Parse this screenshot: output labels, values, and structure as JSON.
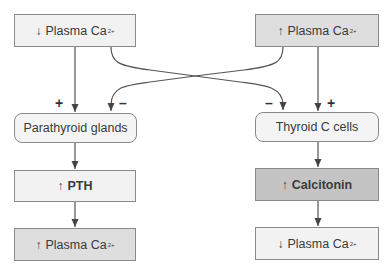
{
  "left_column": {
    "stimulus": {
      "arrow": "↓",
      "label": "Plasma Ca",
      "superscript": "2+"
    },
    "gland": {
      "label": "Parathyroid glands"
    },
    "hormone": {
      "arrow": "↑",
      "label": "PTH"
    },
    "result": {
      "arrow": "↑",
      "label": "Plasma Ca",
      "superscript": "2+"
    }
  },
  "right_column": {
    "stimulus": {
      "arrow": "↑",
      "label": "Plasma Ca",
      "superscript": "2+"
    },
    "gland": {
      "label": "Thyroid C cells"
    },
    "hormone": {
      "arrow": "↑",
      "label": "Calcitonin"
    },
    "result": {
      "arrow": "↓",
      "label": "Plasma Ca",
      "superscript": "2+"
    }
  },
  "signs": {
    "left_plus": "+",
    "left_minus": "–",
    "right_minus": "–",
    "right_plus": "+"
  },
  "colors": {
    "box_light": "#f2f2f2",
    "box_mid": "#dedede",
    "box_dark": "#c4c4c4",
    "line": "#555555"
  }
}
